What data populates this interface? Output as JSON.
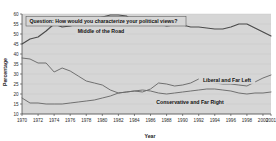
{
  "chart_data": {
    "type": "line",
    "title": "Question: How would you characterize your political views?",
    "xlabel": "Year",
    "ylabel": "Percentage",
    "ylim": [
      10,
      60
    ],
    "xlim": [
      1970,
      2001
    ],
    "grid": true,
    "legend_position": "inline-labels",
    "ytick_labels": [
      "10",
      "15",
      "20",
      "25",
      "30",
      "35",
      "40",
      "45",
      "50",
      "55",
      "60"
    ],
    "yticks": [
      10,
      15,
      20,
      25,
      30,
      35,
      40,
      45,
      50,
      55,
      60
    ],
    "xtick_labels": [
      "1970",
      "1972",
      "1974",
      "1976",
      "1978",
      "1980",
      "1982",
      "1984",
      "1986",
      "1988",
      "1990",
      "1992",
      "1994",
      "1996",
      "1998",
      "2000",
      "2001"
    ],
    "xticks": [
      1970,
      1972,
      1974,
      1976,
      1978,
      1980,
      1982,
      1984,
      1986,
      1988,
      1990,
      1992,
      1994,
      1996,
      1998,
      2000,
      2001
    ],
    "x": [
      1970,
      1971,
      1972,
      1973,
      1974,
      1975,
      1976,
      1977,
      1978,
      1979,
      1980,
      1981,
      1982,
      1983,
      1984,
      1985,
      1986,
      1987,
      1988,
      1989,
      1990,
      1991,
      1992,
      1993,
      1994,
      1995,
      1996,
      1997,
      1998,
      1999,
      2000,
      2001
    ],
    "series": [
      {
        "name": "Middle of the Road",
        "label": "Middle of the Road",
        "values": [
          45.0,
          47.5,
          48.5,
          51.5,
          55.0,
          53.5,
          54.0,
          55.0,
          56.5,
          57.5,
          58.5,
          59.5,
          59.5,
          59.0,
          56.0,
          55.5,
          55.5,
          55.0,
          54.0,
          54.5,
          54.5,
          53.5,
          53.5,
          53.0,
          52.5,
          52.5,
          53.5,
          55.0,
          55.0,
          53.0,
          51.0,
          49.0
        ]
      },
      {
        "name": "Liberal and Far Left",
        "label": "Liberal and Far Left",
        "values": [
          38.0,
          37.5,
          35.5,
          35.5,
          31.0,
          33.0,
          31.5,
          29.0,
          26.5,
          25.5,
          24.5,
          22.0,
          20.5,
          21.0,
          21.5,
          21.0,
          22.5,
          25.5,
          25.0,
          24.0,
          24.5,
          25.5,
          27.5,
          26.5,
          25.5,
          25.0,
          25.0,
          24.5,
          24.0,
          26.0,
          28.0,
          29.5
        ]
      },
      {
        "name": "Conservative and Far Right",
        "label": "Conservative and Far Right",
        "values": [
          18.0,
          15.5,
          15.5,
          15.0,
          15.0,
          15.0,
          15.5,
          16.0,
          16.5,
          17.0,
          18.0,
          19.0,
          20.5,
          21.0,
          21.5,
          22.0,
          21.5,
          20.5,
          20.0,
          20.5,
          21.0,
          21.5,
          22.0,
          22.5,
          22.5,
          22.0,
          21.5,
          20.5,
          20.0,
          20.5,
          20.5,
          21.0
        ]
      }
    ]
  }
}
